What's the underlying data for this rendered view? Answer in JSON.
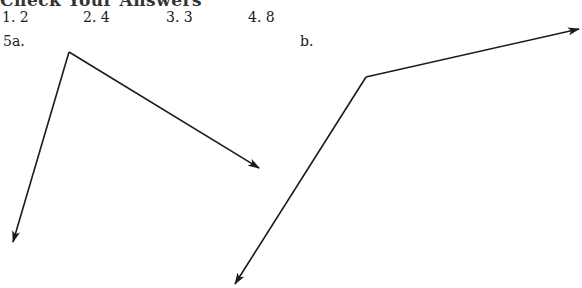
{
  "header": {
    "cut_title": "Check Your Answers"
  },
  "answers": [
    {
      "label": "1. 2",
      "x": 2
    },
    {
      "label": "2. 4",
      "x": 83
    },
    {
      "label": "3. 3",
      "x": 166
    },
    {
      "label": "4. 8",
      "x": 248
    }
  ],
  "problem5": {
    "a": {
      "label": "5a.",
      "vertex": [
        69,
        52
      ],
      "tips": [
        [
          259,
          168
        ],
        [
          13,
          242
        ]
      ]
    },
    "b": {
      "label": "b.",
      "vertex": [
        366,
        77
      ],
      "tips": [
        [
          579,
          29
        ],
        [
          235,
          284
        ]
      ]
    }
  }
}
